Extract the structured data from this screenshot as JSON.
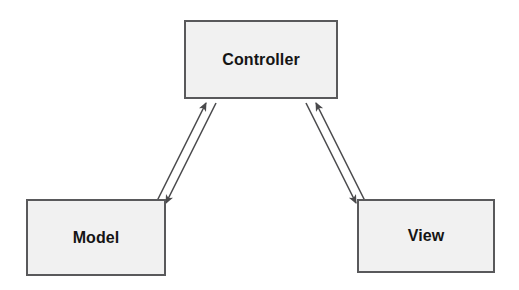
{
  "diagram": {
    "background_color": "#ffffff",
    "node_fill_color": "#f1f1f1",
    "node_border_color": "#59595b",
    "text_color": "#151515",
    "arrow_color": "#4a4a4c",
    "nodes": [
      {
        "id": "controller",
        "label": "Controller",
        "x": 184,
        "y": 20,
        "width": 154,
        "height": 79
      },
      {
        "id": "model",
        "label": "Model",
        "x": 26,
        "y": 199,
        "width": 140,
        "height": 77
      },
      {
        "id": "view",
        "label": "View",
        "x": 357,
        "y": 199,
        "width": 138,
        "height": 74
      }
    ],
    "edges": [
      {
        "id": "model-to-controller",
        "from": "model",
        "to": "controller",
        "label": "",
        "direction": "up-right",
        "arrowhead_at": "controller"
      },
      {
        "id": "controller-to-model",
        "from": "controller",
        "to": "model",
        "label": "",
        "direction": "down-left",
        "arrowhead_at": "model"
      },
      {
        "id": "view-to-controller",
        "from": "view",
        "to": "controller",
        "label": "",
        "direction": "up-left",
        "arrowhead_at": "controller"
      },
      {
        "id": "controller-to-view",
        "from": "controller",
        "to": "view",
        "label": "",
        "direction": "down-right",
        "arrowhead_at": "view"
      }
    ]
  }
}
